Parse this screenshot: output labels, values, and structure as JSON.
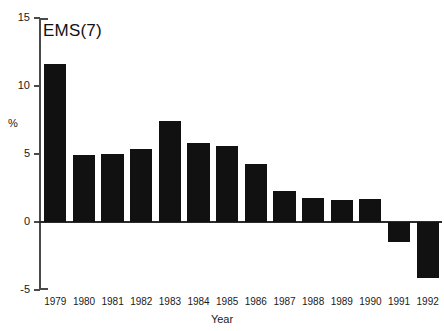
{
  "chart_data": {
    "type": "bar",
    "title": "EMS(7)",
    "xlabel": "Year",
    "ylabel": "%",
    "categories": [
      "1979",
      "1980",
      "1981",
      "1982",
      "1983",
      "1984",
      "1985",
      "1986",
      "1987",
      "1988",
      "1989",
      "1990",
      "1991",
      "1992"
    ],
    "values": [
      11.6,
      4.9,
      5.0,
      5.4,
      7.4,
      5.8,
      5.6,
      4.3,
      2.3,
      1.8,
      1.6,
      1.7,
      -1.5,
      -4.1
    ],
    "ylim": [
      -5,
      15
    ],
    "yticks": [
      15,
      10,
      5,
      0,
      -5
    ],
    "ytick_labels": [
      "15",
      "10",
      "5",
      "0",
      "-5"
    ],
    "grid": false,
    "legend": false,
    "bar_color": "#111111",
    "axis_color": "#4a4a4a",
    "background": "#ffffff"
  },
  "axis_geometry": {
    "zero_y": 222,
    "px_per_unit": 13.6,
    "plot_left": 41,
    "plot_right": 442,
    "top_y": 18,
    "bottom_y": 290
  }
}
